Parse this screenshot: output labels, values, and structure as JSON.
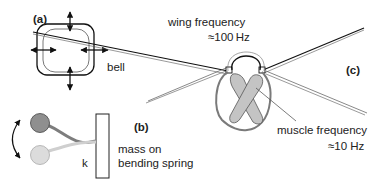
{
  "figure": {
    "panels": [
      {
        "id": "a",
        "label": "(a)",
        "caption": "bell"
      },
      {
        "id": "b",
        "label": "(b)",
        "caption_line1": "mass on",
        "caption_line2": "bending spring",
        "spring_label": "k"
      },
      {
        "id": "c",
        "label": "(c)",
        "wing_label_line1": "wing frequency",
        "wing_label_line2": "≈100 Hz",
        "muscle_label_line1": "muscle frequency",
        "muscle_label_line2": "≈10 Hz"
      }
    ],
    "colors": {
      "stroke": "#222222",
      "mass_dark": "#8f8f8f",
      "mass_light": "#d9d9d9",
      "muscle_fill": "#c4c4c4",
      "body_outline": "#7a7a7a"
    }
  }
}
